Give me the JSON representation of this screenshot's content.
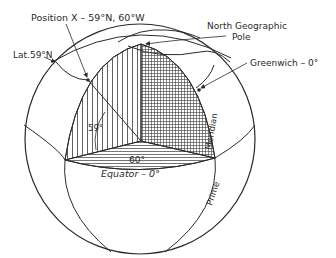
{
  "figure": {
    "type": "globe-coordinates-diagram",
    "labels": {
      "position": "Position X – 59°N, 60°W",
      "latitude": "Lat.59°N",
      "north_pole_line1": "North Geographic",
      "north_pole_line2": "Pole",
      "greenwich": "Greenwich – 0°",
      "meridian": "Meridian",
      "prime": "Prime",
      "angle_lat": "59°",
      "angle_long": "60°",
      "equator": "Equator – 0°"
    },
    "colors": {
      "line": "#2a2a2a",
      "background": "#ffffff"
    }
  }
}
